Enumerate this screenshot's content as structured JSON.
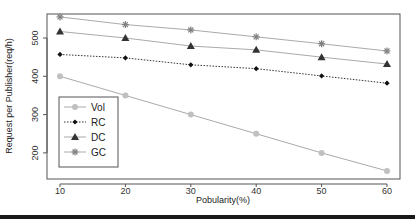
{
  "chart_data": {
    "type": "line",
    "title": "",
    "xlabel": "Pobularity(%)",
    "ylabel": "Request per Publisher(req/h)",
    "x": [
      10,
      20,
      30,
      40,
      50,
      60
    ],
    "xticks": [
      "10",
      "20",
      "30",
      "40",
      "50",
      "60"
    ],
    "yticks": [
      "200",
      "300",
      "400",
      "500"
    ],
    "xlim": [
      8,
      62
    ],
    "ylim": [
      130,
      570
    ],
    "grid": false,
    "legend_position": "bottom-left (inside)",
    "series": [
      {
        "name": "Vol",
        "marker": "circle",
        "line": "solid",
        "color": "#c0c0c0",
        "values": [
          400,
          350,
          300,
          250,
          200,
          153
        ]
      },
      {
        "name": "RC",
        "marker": "diamond",
        "line": "dotted",
        "color": "#111111",
        "values": [
          457,
          448,
          430,
          420,
          401,
          382
        ]
      },
      {
        "name": "DC",
        "marker": "triangle",
        "line": "solid",
        "color": "#333333",
        "values": [
          517,
          500,
          479,
          469,
          450,
          432
        ]
      },
      {
        "name": "GC",
        "marker": "star",
        "line": "solid",
        "color": "#808080",
        "values": [
          555,
          535,
          521,
          503,
          485,
          466
        ]
      }
    ]
  }
}
